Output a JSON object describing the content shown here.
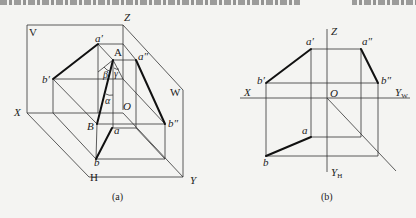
{
  "figure_a": {
    "caption": "(a)",
    "planes": {
      "V": "V",
      "W": "W",
      "H": "H"
    },
    "axes": {
      "X": "X",
      "Y": "Y",
      "Z": "Z",
      "O": "O"
    },
    "points": {
      "A": "A",
      "B": "B",
      "a_prime": "a′",
      "b_prime": "b′",
      "a_dprime": "a″",
      "b_dprime": "b″",
      "a": "a",
      "b": "b"
    },
    "angles": {
      "alpha": "α",
      "beta": "β",
      "gamma": "γ"
    }
  },
  "figure_b": {
    "caption": "(b)",
    "axes": {
      "X": "X",
      "Z": "Z",
      "O": "O",
      "Yw": "Y",
      "Yw_sub": "W",
      "Yh": "Y",
      "Yh_sub": "H"
    },
    "points": {
      "a_prime": "a′",
      "b_prime": "b′",
      "a_dprime": "a″",
      "b_dprime": "b″",
      "a": "a",
      "b": "b"
    }
  }
}
